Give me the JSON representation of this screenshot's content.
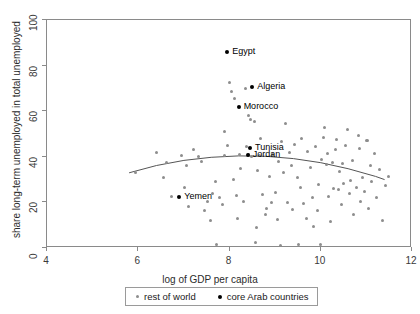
{
  "chart_data": {
    "type": "scatter",
    "title": "",
    "xlabel": "log of GDP per capita",
    "ylabel": "share long-term unemployed in total unemployed",
    "xlim": [
      4,
      12
    ],
    "ylim": [
      0,
      100
    ],
    "xticks": [
      4,
      6,
      8,
      10,
      12
    ],
    "yticks": [
      0,
      20,
      40,
      60,
      80,
      100
    ],
    "grid": false,
    "legend_position": "bottom",
    "legend": [
      {
        "label": "rest of world",
        "marker": "small-gray-dot"
      },
      {
        "label": "core Arab countries",
        "marker": "black-dot"
      }
    ],
    "series": [
      {
        "name": "rest of world",
        "color": "#8d8d8d",
        "points": [
          [
            5.93,
            33.0
          ],
          [
            6.4,
            42.0
          ],
          [
            6.55,
            31.0
          ],
          [
            6.62,
            37.5
          ],
          [
            6.72,
            22.5
          ],
          [
            6.95,
            40.5
          ],
          [
            7.02,
            26.5
          ],
          [
            7.1,
            18.0
          ],
          [
            7.2,
            43.0
          ],
          [
            7.33,
            40.0
          ],
          [
            7.38,
            38.0
          ],
          [
            7.45,
            16.5
          ],
          [
            7.52,
            20.5
          ],
          [
            7.58,
            12.0
          ],
          [
            7.62,
            24.0
          ],
          [
            7.7,
            29.0
          ],
          [
            7.72,
            1.5
          ],
          [
            7.78,
            22.0
          ],
          [
            7.85,
            19.0
          ],
          [
            7.88,
            51.0
          ],
          [
            7.9,
            40.5
          ],
          [
            7.95,
            45.0
          ],
          [
            8.0,
            72.5
          ],
          [
            8.05,
            68.5
          ],
          [
            8.08,
            30.0
          ],
          [
            8.12,
            65.5
          ],
          [
            8.15,
            23.0
          ],
          [
            8.18,
            13.0
          ],
          [
            8.22,
            41.0
          ],
          [
            8.3,
            20.5
          ],
          [
            8.35,
            70.0
          ],
          [
            8.38,
            44.5
          ],
          [
            8.42,
            41.0
          ],
          [
            8.48,
            40.0
          ],
          [
            8.55,
            55.5
          ],
          [
            8.58,
            2.5
          ],
          [
            8.6,
            9.0
          ],
          [
            8.65,
            40.5
          ],
          [
            8.68,
            48.0
          ],
          [
            8.72,
            23.5
          ],
          [
            8.78,
            14.5
          ],
          [
            8.82,
            17.5
          ],
          [
            8.88,
            31.5
          ],
          [
            8.92,
            20.0
          ],
          [
            8.95,
            41.0
          ],
          [
            9.0,
            24.5
          ],
          [
            9.05,
            12.5
          ],
          [
            9.08,
            38.0
          ],
          [
            9.12,
            1.0
          ],
          [
            9.15,
            46.5
          ],
          [
            9.18,
            33.0
          ],
          [
            9.22,
            54.5
          ],
          [
            9.28,
            20.0
          ],
          [
            9.32,
            42.0
          ],
          [
            9.38,
            17.0
          ],
          [
            9.42,
            45.5
          ],
          [
            9.48,
            31.0
          ],
          [
            9.52,
            1.5
          ],
          [
            9.55,
            26.5
          ],
          [
            9.58,
            48.0
          ],
          [
            9.62,
            19.5
          ],
          [
            9.68,
            13.0
          ],
          [
            9.72,
            42.5
          ],
          [
            9.78,
            35.5
          ],
          [
            9.82,
            22.0
          ],
          [
            9.88,
            44.5
          ],
          [
            9.92,
            16.5
          ],
          [
            9.95,
            28.0
          ],
          [
            10.0,
            1.5
          ],
          [
            10.02,
            39.0
          ],
          [
            10.05,
            48.5
          ],
          [
            10.08,
            53.0
          ],
          [
            10.12,
            36.5
          ],
          [
            10.15,
            41.5
          ],
          [
            10.18,
            22.5
          ],
          [
            10.22,
            11.5
          ],
          [
            10.28,
            26.0
          ],
          [
            10.32,
            43.0
          ],
          [
            10.35,
            47.5
          ],
          [
            10.38,
            25.5
          ],
          [
            10.42,
            33.5
          ],
          [
            10.45,
            19.0
          ],
          [
            10.5,
            28.5
          ],
          [
            10.55,
            45.0
          ],
          [
            10.58,
            52.0
          ],
          [
            10.62,
            24.0
          ],
          [
            10.65,
            29.5
          ],
          [
            10.7,
            38.5
          ],
          [
            10.72,
            14.5
          ],
          [
            10.78,
            26.5
          ],
          [
            10.82,
            49.5
          ],
          [
            10.85,
            43.5
          ],
          [
            10.88,
            20.5
          ],
          [
            10.92,
            31.0
          ],
          [
            10.95,
            25.0
          ],
          [
            11.0,
            47.0
          ],
          [
            11.02,
            47.0
          ],
          [
            11.05,
            17.5
          ],
          [
            11.08,
            36.0
          ],
          [
            11.12,
            29.0
          ],
          [
            11.18,
            41.5
          ],
          [
            11.22,
            22.0
          ],
          [
            11.28,
            34.5
          ],
          [
            11.35,
            12.0
          ],
          [
            11.42,
            27.5
          ],
          [
            11.48,
            31.5
          ],
          [
            8.42,
            58.0
          ],
          [
            8.45,
            56.5
          ],
          [
            8.25,
            35.0
          ],
          [
            9.35,
            36.0
          ],
          [
            10.25,
            37.5
          ],
          [
            10.48,
            37.0
          ],
          [
            9.85,
            9.5
          ],
          [
            8.62,
            34.0
          ],
          [
            7.05,
            36.0
          ]
        ]
      },
      {
        "name": "core Arab countries",
        "color": "#000000",
        "points": [
          {
            "country": "Egypt",
            "x": 7.95,
            "y": 86.0
          },
          {
            "country": "Algeria",
            "x": 8.5,
            "y": 70.5
          },
          {
            "country": "Morocco",
            "x": 8.2,
            "y": 62.0
          },
          {
            "country": "Tunisia",
            "x": 8.45,
            "y": 44.0
          },
          {
            "country": "Jordan",
            "x": 8.4,
            "y": 41.0
          },
          {
            "country": "Yemen",
            "x": 6.9,
            "y": 22.5
          }
        ]
      }
    ],
    "fit_curve": {
      "name": "quadratic fit",
      "color": "#555555",
      "points": [
        [
          5.8,
          33.0
        ],
        [
          6.4,
          36.2
        ],
        [
          7.0,
          38.4
        ],
        [
          7.6,
          39.8
        ],
        [
          8.2,
          40.4
        ],
        [
          8.8,
          40.2
        ],
        [
          9.4,
          39.2
        ],
        [
          10.0,
          37.4
        ],
        [
          10.6,
          34.8
        ],
        [
          11.2,
          31.4
        ],
        [
          11.4,
          30.0
        ]
      ]
    },
    "point_labels": [
      {
        "text": "Egypt",
        "x": 7.95,
        "y": 86.0
      },
      {
        "text": "Algeria",
        "x": 8.5,
        "y": 70.5
      },
      {
        "text": "Morocco",
        "x": 8.2,
        "y": 62.0
      },
      {
        "text": "Tunisia",
        "x": 8.45,
        "y": 44.0
      },
      {
        "text": "Jordan",
        "x": 8.4,
        "y": 41.0
      },
      {
        "text": "Yemen",
        "x": 6.9,
        "y": 22.5
      }
    ]
  }
}
